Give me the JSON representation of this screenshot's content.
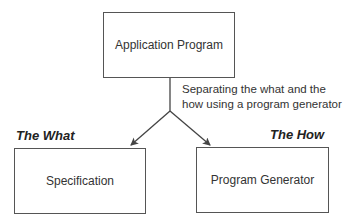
{
  "diagram": {
    "top_box": {
      "label": "Application Program"
    },
    "caption": {
      "line1": "Separating the what and the",
      "line2": "how using a program generator"
    },
    "left": {
      "heading": "The What",
      "box_label": "Specification"
    },
    "right": {
      "heading": "The How",
      "box_label": "Program Generator"
    },
    "colors": {
      "line": "#444444",
      "border": "#555555"
    }
  }
}
